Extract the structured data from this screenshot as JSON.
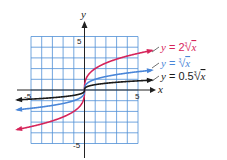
{
  "chart_data": {
    "type": "line",
    "title": "",
    "xlabel": "x",
    "ylabel": "y",
    "xlim": [
      -5,
      5
    ],
    "ylim": [
      -5,
      5
    ],
    "grid": true,
    "x_ticks_labeled": [
      -5,
      5
    ],
    "y_ticks_labeled": [
      -5,
      5
    ],
    "x_tick_labels": [
      "-5",
      "5"
    ],
    "y_tick_labels": [
      "-5",
      "5"
    ],
    "legend_position": "right, inline labels",
    "series": [
      {
        "name": "y = 2∛x",
        "label_prefix": "y = 2",
        "function": "2*cbrt(x)",
        "coef": 2,
        "color": "#d6245a",
        "x": [
          -6.3,
          -5,
          -4,
          -3,
          -2,
          -1,
          -0.5,
          -0.1,
          0,
          0.1,
          0.5,
          1,
          2,
          3,
          4,
          5,
          6.3
        ],
        "y": [
          -3.69,
          -3.42,
          -3.17,
          -2.88,
          -2.52,
          -2.0,
          -1.59,
          -0.93,
          0,
          0.93,
          1.59,
          2.0,
          2.52,
          2.88,
          3.17,
          3.42,
          3.69
        ]
      },
      {
        "name": "y = ∛x",
        "label_prefix": "y = ",
        "function": "cbrt(x)",
        "coef": 1,
        "color": "#4a86d8",
        "x": [
          -6.3,
          -5,
          -4,
          -3,
          -2,
          -1,
          -0.5,
          -0.1,
          0,
          0.1,
          0.5,
          1,
          2,
          3,
          4,
          5,
          6.3
        ],
        "y": [
          -1.85,
          -1.71,
          -1.59,
          -1.44,
          -1.26,
          -1.0,
          -0.79,
          -0.46,
          0,
          0.46,
          0.79,
          1.0,
          1.26,
          1.44,
          1.59,
          1.71,
          1.85
        ]
      },
      {
        "name": "y = 0.5∛x",
        "label_prefix": "y = 0.5",
        "function": "0.5*cbrt(x)",
        "coef": 0.5,
        "color": "#1a1a1a",
        "x": [
          -6.3,
          -5,
          -4,
          -3,
          -2,
          -1,
          -0.5,
          -0.1,
          0,
          0.1,
          0.5,
          1,
          2,
          3,
          4,
          5,
          6.3
        ],
        "y": [
          -0.92,
          -0.85,
          -0.79,
          -0.72,
          -0.63,
          -0.5,
          -0.4,
          -0.23,
          0,
          0.23,
          0.4,
          0.5,
          0.63,
          0.72,
          0.79,
          0.85,
          0.92
        ]
      }
    ]
  },
  "colors": {
    "grid": "#4f8fd6",
    "axis": "#222222"
  }
}
